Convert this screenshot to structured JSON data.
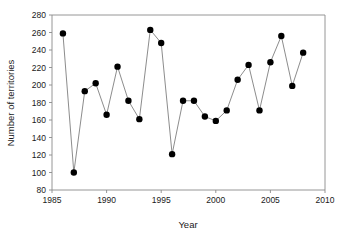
{
  "chart_data": {
    "type": "line",
    "title": "",
    "xlabel": "Year",
    "ylabel": "Number of territories",
    "xlim": [
      1985,
      2010
    ],
    "ylim": [
      80,
      280
    ],
    "xticks": [
      1985,
      1990,
      1995,
      2000,
      2005,
      2010
    ],
    "yticks": [
      80,
      100,
      120,
      140,
      160,
      180,
      200,
      220,
      240,
      260,
      280
    ],
    "xtick_labels": [
      "1985",
      "1990",
      "1995",
      "2000",
      "2005",
      "2010"
    ],
    "ytick_labels": [
      "80",
      "100",
      "120",
      "140",
      "160",
      "180",
      "200",
      "220",
      "240",
      "260",
      "280"
    ],
    "grid": false,
    "legend": null,
    "marker": "filled-circle",
    "marker_color": "#000000",
    "line_color": "#6e6e6e",
    "x": [
      1986,
      1987,
      1988,
      1989,
      1990,
      1991,
      1992,
      1993,
      1994,
      1995,
      1996,
      1997,
      1998,
      1999,
      2000,
      2001,
      2002,
      2003,
      2004,
      2005,
      2006,
      2007,
      2008
    ],
    "values": [
      259,
      100,
      193,
      202,
      166,
      221,
      182,
      161,
      263,
      248,
      121,
      182,
      182,
      164,
      159,
      171,
      206,
      223,
      171,
      226,
      256,
      199,
      237
    ],
    "series": [
      {
        "name": "Number of territories",
        "values": [
          259,
          100,
          193,
          202,
          166,
          221,
          182,
          161,
          263,
          248,
          121,
          182,
          182,
          164,
          159,
          171,
          206,
          223,
          171,
          226,
          256,
          199,
          237
        ]
      }
    ]
  }
}
